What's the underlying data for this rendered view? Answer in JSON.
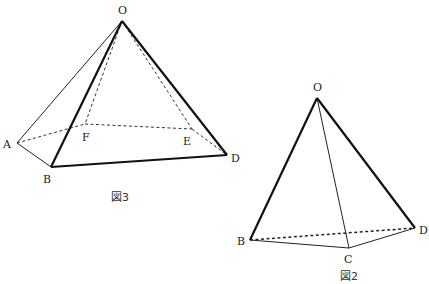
{
  "figure3": {
    "caption": "図3",
    "labels": {
      "O": "O",
      "A": "A",
      "B": "B",
      "F": "F",
      "E": "E",
      "D": "D"
    },
    "vertices": {
      "O": [
        122,
        21
      ],
      "A": [
        17,
        143
      ],
      "B": [
        51,
        167
      ],
      "F": [
        85,
        124
      ],
      "E": [
        192,
        129
      ],
      "D": [
        227,
        155
      ]
    },
    "edges_solid_thick": [
      [
        "O",
        "B"
      ],
      [
        "O",
        "D"
      ],
      [
        "B",
        "D"
      ]
    ],
    "edges_solid_thin": [
      [
        "O",
        "A"
      ],
      [
        "A",
        "B"
      ]
    ],
    "edges_dashed": [
      [
        "O",
        "F"
      ],
      [
        "O",
        "E"
      ],
      [
        "A",
        "F"
      ],
      [
        "F",
        "E"
      ],
      [
        "E",
        "D"
      ]
    ]
  },
  "figure2": {
    "caption": "図2",
    "labels": {
      "O": "O",
      "B": "B",
      "C": "C",
      "D": "D"
    },
    "vertices": {
      "O": [
        317,
        98
      ],
      "B": [
        250,
        240
      ],
      "C": [
        349,
        248
      ],
      "D": [
        415,
        228
      ]
    },
    "edges_solid_thick": [
      [
        "O",
        "B"
      ],
      [
        "O",
        "D"
      ]
    ],
    "edges_solid_thin": [
      [
        "O",
        "C"
      ],
      [
        "B",
        "C"
      ],
      [
        "C",
        "D"
      ]
    ],
    "edges_dashed": [
      [
        "B",
        "D"
      ]
    ]
  }
}
